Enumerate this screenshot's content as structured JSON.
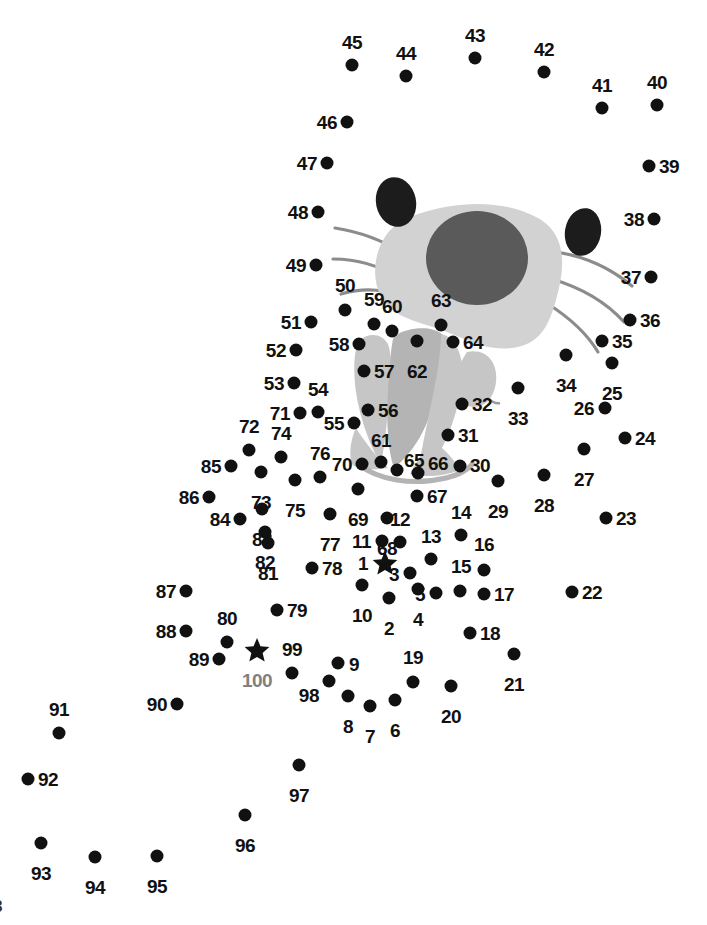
{
  "page": {
    "background_color": "#ffffff",
    "width": 707,
    "height": 925,
    "corner_mark": "8"
  },
  "colors": {
    "dot": "#111111",
    "label": "#111111",
    "label_muted": "#808080",
    "head_fill": "#d2d2d2",
    "head_patch": "#5a5a5a",
    "ear_fill": "#1c1c1c",
    "whisker": "#8c8c8c",
    "flower_fill": "#c6c6c6",
    "flower_shade": "#b4b4b4"
  },
  "artwork": {
    "description": "Partially drawn cat head with ears and whiskers above a tulip flower",
    "shapes": [
      "head-blob",
      "head-patch",
      "ear-left",
      "ear-right",
      "whiskers-left",
      "whiskers-right",
      "flower-petals",
      "flower-leaf"
    ]
  },
  "dots": [
    {
      "n": "1",
      "x": 385,
      "y": 563,
      "shape": "star",
      "lx": 368,
      "ly": 564,
      "pos": "r"
    },
    {
      "n": "2",
      "x": 389,
      "y": 598,
      "shape": "dot",
      "lx": 389,
      "ly": 618,
      "pos": "b"
    },
    {
      "n": "3",
      "x": 410,
      "y": 573,
      "shape": "dot",
      "lx": 399,
      "ly": 575,
      "pos": "r"
    },
    {
      "n": "4",
      "x": 418,
      "y": 589,
      "shape": "dot",
      "lx": 418,
      "ly": 609,
      "pos": "b"
    },
    {
      "n": "5",
      "x": 436,
      "y": 593,
      "shape": "dot",
      "lx": 425,
      "ly": 595,
      "pos": "r"
    },
    {
      "n": "6",
      "x": 395,
      "y": 700,
      "shape": "dot",
      "lx": 395,
      "ly": 720,
      "pos": "b"
    },
    {
      "n": "7",
      "x": 370,
      "y": 706,
      "shape": "dot",
      "lx": 370,
      "ly": 726,
      "pos": "b"
    },
    {
      "n": "8",
      "x": 348,
      "y": 696,
      "shape": "dot",
      "lx": 348,
      "ly": 716,
      "pos": "b"
    },
    {
      "n": "9",
      "x": 338,
      "y": 663,
      "shape": "dot",
      "lx": 349,
      "ly": 665,
      "pos": "l"
    },
    {
      "n": "10",
      "x": 362,
      "y": 585,
      "shape": "dot",
      "lx": 362,
      "ly": 605,
      "pos": "b"
    },
    {
      "n": "11",
      "x": 382,
      "y": 541,
      "shape": "dot",
      "lx": 371,
      "ly": 542,
      "pos": "r"
    },
    {
      "n": "12",
      "x": 400,
      "y": 542,
      "shape": "dot",
      "lx": 400,
      "ly": 531,
      "pos": "t"
    },
    {
      "n": "13",
      "x": 431,
      "y": 559,
      "shape": "dot",
      "lx": 431,
      "ly": 548,
      "pos": "t"
    },
    {
      "n": "14",
      "x": 461,
      "y": 535,
      "shape": "dot",
      "lx": 461,
      "ly": 524,
      "pos": "t"
    },
    {
      "n": "15",
      "x": 460,
      "y": 591,
      "shape": "dot",
      "lx": 461,
      "ly": 578,
      "pos": "t"
    },
    {
      "n": "16",
      "x": 484,
      "y": 570,
      "shape": "dot",
      "lx": 484,
      "ly": 556,
      "pos": "t"
    },
    {
      "n": "17",
      "x": 484,
      "y": 594,
      "shape": "dot",
      "lx": 494,
      "ly": 595,
      "pos": "l"
    },
    {
      "n": "18",
      "x": 470,
      "y": 633,
      "shape": "dot",
      "lx": 480,
      "ly": 634,
      "pos": "l"
    },
    {
      "n": "19",
      "x": 413,
      "y": 682,
      "shape": "dot",
      "lx": 413,
      "ly": 669,
      "pos": "t"
    },
    {
      "n": "20",
      "x": 451,
      "y": 686,
      "shape": "dot",
      "lx": 451,
      "ly": 706,
      "pos": "b"
    },
    {
      "n": "21",
      "x": 514,
      "y": 654,
      "shape": "dot",
      "lx": 514,
      "ly": 674,
      "pos": "b"
    },
    {
      "n": "22",
      "x": 572,
      "y": 592,
      "shape": "dot",
      "lx": 582,
      "ly": 593,
      "pos": "l"
    },
    {
      "n": "23",
      "x": 606,
      "y": 518,
      "shape": "dot",
      "lx": 616,
      "ly": 519,
      "pos": "l"
    },
    {
      "n": "24",
      "x": 625,
      "y": 438,
      "shape": "dot",
      "lx": 635,
      "ly": 439,
      "pos": "l"
    },
    {
      "n": "25",
      "x": 612,
      "y": 363,
      "shape": "dot",
      "lx": 612,
      "ly": 383,
      "pos": "b"
    },
    {
      "n": "26",
      "x": 605,
      "y": 408,
      "shape": "dot",
      "lx": 594,
      "ly": 409,
      "pos": "r"
    },
    {
      "n": "27",
      "x": 584,
      "y": 449,
      "shape": "dot",
      "lx": 584,
      "ly": 469,
      "pos": "b"
    },
    {
      "n": "28",
      "x": 544,
      "y": 475,
      "shape": "dot",
      "lx": 544,
      "ly": 495,
      "pos": "b"
    },
    {
      "n": "29",
      "x": 498,
      "y": 481,
      "shape": "dot",
      "lx": 498,
      "ly": 501,
      "pos": "b"
    },
    {
      "n": "30",
      "x": 460,
      "y": 466,
      "shape": "dot",
      "lx": 470,
      "ly": 466,
      "pos": "l"
    },
    {
      "n": "31",
      "x": 448,
      "y": 435,
      "shape": "dot",
      "lx": 458,
      "ly": 436,
      "pos": "l"
    },
    {
      "n": "32",
      "x": 462,
      "y": 404,
      "shape": "dot",
      "lx": 472,
      "ly": 405,
      "pos": "l"
    },
    {
      "n": "33",
      "x": 518,
      "y": 388,
      "shape": "dot",
      "lx": 518,
      "ly": 408,
      "pos": "b"
    },
    {
      "n": "34",
      "x": 566,
      "y": 355,
      "shape": "dot",
      "lx": 566,
      "ly": 375,
      "pos": "b"
    },
    {
      "n": "35",
      "x": 602,
      "y": 341,
      "shape": "dot",
      "lx": 612,
      "ly": 342,
      "pos": "l"
    },
    {
      "n": "36",
      "x": 630,
      "y": 320,
      "shape": "dot",
      "lx": 640,
      "ly": 321,
      "pos": "l"
    },
    {
      "n": "37",
      "x": 651,
      "y": 277,
      "shape": "dot",
      "lx": 641,
      "ly": 278,
      "pos": "r"
    },
    {
      "n": "38",
      "x": 654,
      "y": 219,
      "shape": "dot",
      "lx": 644,
      "ly": 220,
      "pos": "r"
    },
    {
      "n": "39",
      "x": 649,
      "y": 166,
      "shape": "dot",
      "lx": 659,
      "ly": 167,
      "pos": "l"
    },
    {
      "n": "40",
      "x": 657,
      "y": 105,
      "shape": "dot",
      "lx": 657,
      "ly": 94,
      "pos": "t"
    },
    {
      "n": "41",
      "x": 602,
      "y": 108,
      "shape": "dot",
      "lx": 602,
      "ly": 97,
      "pos": "t"
    },
    {
      "n": "42",
      "x": 544,
      "y": 72,
      "shape": "dot",
      "lx": 544,
      "ly": 61,
      "pos": "t"
    },
    {
      "n": "43",
      "x": 475,
      "y": 58,
      "shape": "dot",
      "lx": 475,
      "ly": 47,
      "pos": "t"
    },
    {
      "n": "44",
      "x": 406,
      "y": 76,
      "shape": "dot",
      "lx": 406,
      "ly": 65,
      "pos": "t"
    },
    {
      "n": "45",
      "x": 352,
      "y": 65,
      "shape": "dot",
      "lx": 352,
      "ly": 54,
      "pos": "t"
    },
    {
      "n": "46",
      "x": 347,
      "y": 122,
      "shape": "dot",
      "lx": 337,
      "ly": 123,
      "pos": "r"
    },
    {
      "n": "47",
      "x": 327,
      "y": 163,
      "shape": "dot",
      "lx": 317,
      "ly": 164,
      "pos": "r"
    },
    {
      "n": "48",
      "x": 318,
      "y": 212,
      "shape": "dot",
      "lx": 308,
      "ly": 213,
      "pos": "r"
    },
    {
      "n": "49",
      "x": 316,
      "y": 265,
      "shape": "dot",
      "lx": 306,
      "ly": 266,
      "pos": "r"
    },
    {
      "n": "50",
      "x": 345,
      "y": 310,
      "shape": "dot",
      "lx": 345,
      "ly": 297,
      "pos": "t"
    },
    {
      "n": "51",
      "x": 311,
      "y": 322,
      "shape": "dot",
      "lx": 301,
      "ly": 323,
      "pos": "r"
    },
    {
      "n": "52",
      "x": 296,
      "y": 350,
      "shape": "dot",
      "lx": 286,
      "ly": 351,
      "pos": "r"
    },
    {
      "n": "53",
      "x": 294,
      "y": 383,
      "shape": "dot",
      "lx": 284,
      "ly": 384,
      "pos": "r"
    },
    {
      "n": "54",
      "x": 318,
      "y": 412,
      "shape": "dot",
      "lx": 318,
      "ly": 401,
      "pos": "t"
    },
    {
      "n": "55",
      "x": 354,
      "y": 423,
      "shape": "dot",
      "lx": 344,
      "ly": 424,
      "pos": "r"
    },
    {
      "n": "56",
      "x": 368,
      "y": 410,
      "shape": "dot",
      "lx": 378,
      "ly": 411,
      "pos": "l"
    },
    {
      "n": "57",
      "x": 364,
      "y": 371,
      "shape": "dot",
      "lx": 374,
      "ly": 372,
      "pos": "l"
    },
    {
      "n": "58",
      "x": 359,
      "y": 344,
      "shape": "dot",
      "lx": 349,
      "ly": 345,
      "pos": "r"
    },
    {
      "n": "59",
      "x": 374,
      "y": 324,
      "shape": "dot",
      "lx": 374,
      "ly": 311,
      "pos": "t"
    },
    {
      "n": "60",
      "x": 392,
      "y": 331,
      "shape": "dot",
      "lx": 392,
      "ly": 318,
      "pos": "t"
    },
    {
      "n": "61",
      "x": 381,
      "y": 462,
      "shape": "dot",
      "lx": 381,
      "ly": 452,
      "pos": "t"
    },
    {
      "n": "62",
      "x": 417,
      "y": 341,
      "shape": "dot",
      "lx": 417,
      "ly": 361,
      "pos": "b"
    },
    {
      "n": "63",
      "x": 441,
      "y": 325,
      "shape": "dot",
      "lx": 441,
      "ly": 312,
      "pos": "t"
    },
    {
      "n": "64",
      "x": 453,
      "y": 342,
      "shape": "dot",
      "lx": 463,
      "ly": 343,
      "pos": "l"
    },
    {
      "n": "65",
      "x": 397,
      "y": 470,
      "shape": "dot",
      "lx": 404,
      "ly": 461,
      "pos": "l"
    },
    {
      "n": "66",
      "x": 418,
      "y": 473,
      "shape": "dot",
      "lx": 428,
      "ly": 464,
      "pos": "l"
    },
    {
      "n": "67",
      "x": 417,
      "y": 496,
      "shape": "dot",
      "lx": 427,
      "ly": 497,
      "pos": "l"
    },
    {
      "n": "68",
      "x": 387,
      "y": 518,
      "shape": "dot",
      "lx": 387,
      "ly": 538,
      "pos": "b"
    },
    {
      "n": "69",
      "x": 358,
      "y": 489,
      "shape": "dot",
      "lx": 358,
      "ly": 509,
      "pos": "b"
    },
    {
      "n": "70",
      "x": 362,
      "y": 464,
      "shape": "dot",
      "lx": 352,
      "ly": 465,
      "pos": "r"
    },
    {
      "n": "71",
      "x": 300,
      "y": 413,
      "shape": "dot",
      "lx": 290,
      "ly": 414,
      "pos": "r"
    },
    {
      "n": "72",
      "x": 249,
      "y": 450,
      "shape": "dot",
      "lx": 249,
      "ly": 438,
      "pos": "t"
    },
    {
      "n": "73",
      "x": 261,
      "y": 472,
      "shape": "dot",
      "lx": 261,
      "ly": 492,
      "pos": "b"
    },
    {
      "n": "74",
      "x": 281,
      "y": 457,
      "shape": "dot",
      "lx": 281,
      "ly": 445,
      "pos": "t"
    },
    {
      "n": "75",
      "x": 295,
      "y": 480,
      "shape": "dot",
      "lx": 295,
      "ly": 500,
      "pos": "b"
    },
    {
      "n": "76",
      "x": 320,
      "y": 477,
      "shape": "dot",
      "lx": 320,
      "ly": 465,
      "pos": "t"
    },
    {
      "n": "77",
      "x": 330,
      "y": 514,
      "shape": "dot",
      "lx": 330,
      "ly": 534,
      "pos": "b"
    },
    {
      "n": "78",
      "x": 312,
      "y": 568,
      "shape": "dot",
      "lx": 322,
      "ly": 569,
      "pos": "l"
    },
    {
      "n": "79",
      "x": 277,
      "y": 610,
      "shape": "dot",
      "lx": 287,
      "ly": 611,
      "pos": "l"
    },
    {
      "n": "80",
      "x": 227,
      "y": 642,
      "shape": "dot",
      "lx": 227,
      "ly": 630,
      "pos": "t"
    },
    {
      "n": "81",
      "x": 268,
      "y": 543,
      "shape": "dot",
      "lx": 268,
      "ly": 563,
      "pos": "b"
    },
    {
      "n": "82",
      "x": 265,
      "y": 532,
      "shape": "dot",
      "lx": 265,
      "ly": 552,
      "pos": "b"
    },
    {
      "n": "83",
      "x": 262,
      "y": 509,
      "shape": "dot",
      "lx": 262,
      "ly": 529,
      "pos": "b"
    },
    {
      "n": "84",
      "x": 240,
      "y": 519,
      "shape": "dot",
      "lx": 230,
      "ly": 520,
      "pos": "r"
    },
    {
      "n": "85",
      "x": 231,
      "y": 466,
      "shape": "dot",
      "lx": 221,
      "ly": 467,
      "pos": "r"
    },
    {
      "n": "86",
      "x": 209,
      "y": 497,
      "shape": "dot",
      "lx": 199,
      "ly": 498,
      "pos": "r"
    },
    {
      "n": "87",
      "x": 186,
      "y": 591,
      "shape": "dot",
      "lx": 176,
      "ly": 592,
      "pos": "r"
    },
    {
      "n": "88",
      "x": 186,
      "y": 631,
      "shape": "dot",
      "lx": 176,
      "ly": 632,
      "pos": "r"
    },
    {
      "n": "89",
      "x": 219,
      "y": 659,
      "shape": "dot",
      "lx": 209,
      "ly": 660,
      "pos": "r"
    },
    {
      "n": "90",
      "x": 177,
      "y": 704,
      "shape": "dot",
      "lx": 167,
      "ly": 705,
      "pos": "r"
    },
    {
      "n": "91",
      "x": 59,
      "y": 733,
      "shape": "dot",
      "lx": 59,
      "ly": 721,
      "pos": "t"
    },
    {
      "n": "92",
      "x": 28,
      "y": 779,
      "shape": "dot",
      "lx": 38,
      "ly": 780,
      "pos": "l"
    },
    {
      "n": "93",
      "x": 41,
      "y": 843,
      "shape": "dot",
      "lx": 41,
      "ly": 863,
      "pos": "b"
    },
    {
      "n": "94",
      "x": 95,
      "y": 857,
      "shape": "dot",
      "lx": 95,
      "ly": 877,
      "pos": "b"
    },
    {
      "n": "95",
      "x": 157,
      "y": 856,
      "shape": "dot",
      "lx": 157,
      "ly": 876,
      "pos": "b"
    },
    {
      "n": "96",
      "x": 245,
      "y": 815,
      "shape": "dot",
      "lx": 245,
      "ly": 835,
      "pos": "b"
    },
    {
      "n": "97",
      "x": 299,
      "y": 765,
      "shape": "dot",
      "lx": 299,
      "ly": 785,
      "pos": "b"
    },
    {
      "n": "98",
      "x": 329,
      "y": 681,
      "shape": "dot",
      "lx": 319,
      "ly": 696,
      "pos": "r"
    },
    {
      "n": "99",
      "x": 292,
      "y": 673,
      "shape": "dot",
      "lx": 292,
      "ly": 661,
      "pos": "t"
    },
    {
      "n": "100",
      "x": 257,
      "y": 650,
      "shape": "star",
      "lx": 257,
      "ly": 670,
      "pos": "b",
      "muted": true
    }
  ]
}
